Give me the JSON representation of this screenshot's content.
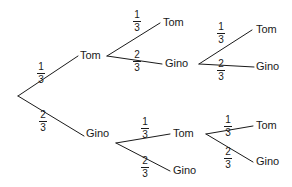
{
  "diagram": {
    "type": "probability-tree",
    "outcome_up": "Tom",
    "outcome_down": "Gino",
    "prob_up": "1",
    "prob_up_den": "3",
    "prob_down": "2",
    "prob_down_den": "3",
    "line_color": "#1a1a1a",
    "background_color": "#ffffff"
  },
  "nodes": {
    "level1_top": "Tom",
    "level1_bottom": "Gino",
    "level2_top_top": "Tom",
    "level2_top_bottom": "Gino",
    "level2_bottom_top": "Tom",
    "level2_bottom_bottom": "Gino",
    "level3_a_top": "Tom",
    "level3_a_bottom": "Gino",
    "level3_b_top": "Tom",
    "level3_b_bottom": "Gino"
  },
  "fractions": {
    "root_up_num": "1",
    "root_up_den": "3",
    "root_down_num": "2",
    "root_down_den": "3",
    "b1_up_num": "1",
    "b1_up_den": "3",
    "b1_down_num": "2",
    "b1_down_den": "3",
    "b2_up_num": "1",
    "b2_up_den": "3",
    "b2_down_num": "2",
    "b2_down_den": "3",
    "b3_up_num": "1",
    "b3_up_den": "3",
    "b3_down_num": "2",
    "b3_down_den": "3",
    "b4_up_num": "1",
    "b4_up_den": "3",
    "b4_down_num": "2",
    "b4_down_den": "3"
  }
}
